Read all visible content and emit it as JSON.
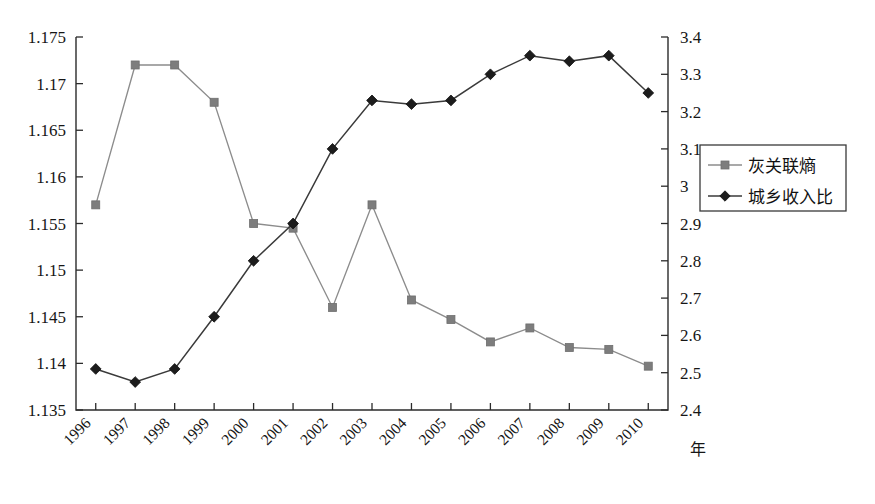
{
  "chart_data": {
    "type": "line",
    "title": "",
    "xlabel": "年",
    "ylabel": "",
    "ylabel_right": "",
    "grid": false,
    "legend_position": "right",
    "categories": [
      "1996",
      "1997",
      "1998",
      "1999",
      "2000",
      "2001",
      "2002",
      "2003",
      "2004",
      "2005",
      "2006",
      "2007",
      "2008",
      "2009",
      "2010"
    ],
    "axes": {
      "left": {
        "ylim": [
          1.135,
          1.175
        ],
        "ticks": [
          "1.135",
          "1.14",
          "1.145",
          "1.15",
          "1.155",
          "1.16",
          "1.165",
          "1.17",
          "1.175"
        ],
        "tick_values": [
          1.135,
          1.14,
          1.145,
          1.15,
          1.155,
          1.16,
          1.165,
          1.17,
          1.175
        ]
      },
      "right": {
        "ylim": [
          2.4,
          3.4
        ],
        "ticks": [
          "2.4",
          "2.5",
          "2.6",
          "2.7",
          "2.8",
          "2.9",
          "3",
          "3.1",
          "3.2",
          "3.3",
          "3.4"
        ],
        "tick_values": [
          2.4,
          2.5,
          2.6,
          2.7,
          2.8,
          2.9,
          3.0,
          3.1,
          3.2,
          3.3,
          3.4
        ]
      }
    },
    "series": [
      {
        "name": "灰关联熵",
        "axis": "left",
        "marker": "square",
        "color": "#7d7d7d",
        "values": [
          1.157,
          1.172,
          1.172,
          1.168,
          1.155,
          1.1545,
          1.146,
          1.157,
          1.1468,
          1.1447,
          1.1423,
          1.1438,
          1.1417,
          1.1415,
          1.1397
        ]
      },
      {
        "name": "城乡收入比",
        "axis": "right",
        "marker": "diamond",
        "color": "#1c1c1c",
        "values": [
          2.51,
          2.475,
          2.51,
          2.65,
          2.8,
          2.9,
          3.1,
          3.23,
          3.22,
          3.23,
          3.3,
          3.35,
          3.335,
          3.35,
          3.25
        ]
      }
    ]
  },
  "legend": {
    "entries": [
      {
        "label": "灰关联熵"
      },
      {
        "label": "城乡收入比"
      }
    ]
  },
  "xaxis": {
    "title": "年"
  }
}
